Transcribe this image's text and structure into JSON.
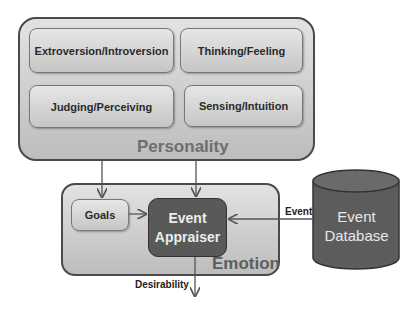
{
  "personality": {
    "label": "Personality",
    "traits": [
      {
        "label": "Extroversion/Introversion"
      },
      {
        "label": "Thinking/Feeling"
      },
      {
        "label": "Judging/Perceiving"
      },
      {
        "label": "Sensing/Intuition"
      }
    ]
  },
  "emotion": {
    "label": "Emotion",
    "goals": "Goals",
    "appraiser": {
      "line1": "Event",
      "line2": "Appraiser"
    }
  },
  "database": {
    "line1": "Event",
    "line2": "Database"
  },
  "edges": {
    "event_label": "Event",
    "desirability_label": "Desirability"
  }
}
